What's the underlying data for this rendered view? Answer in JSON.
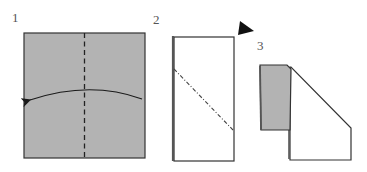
{
  "colors": {
    "paper_colored": "#b3b3b3",
    "paper_white": "#ffffff",
    "outline": "#333333",
    "arrow": "#1a1a1a"
  },
  "steps": [
    {
      "number": "1",
      "description": "Square of paper, colored side up, with vertical valley-fold line through the center and an arrow folding the right half over to the left"
    },
    {
      "number": "2",
      "description": "Folded rectangle with a diagonal mountain-fold line; black triangle marker indicating flip/turn over"
    },
    {
      "number": "3",
      "description": "Resulting shape: colored flap on left over white pentagon with a cut-off upper-right corner"
    }
  ]
}
